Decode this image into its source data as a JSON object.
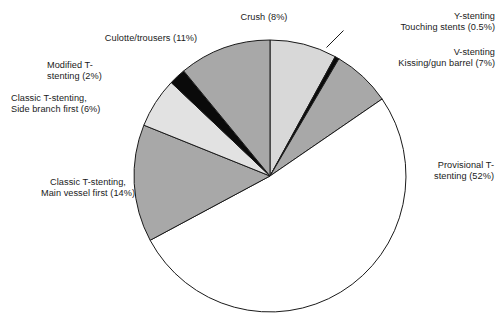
{
  "figure": {
    "background_color": "#ffffff",
    "outline_color": "#1a1a1a"
  },
  "chart_data": {
    "type": "pie",
    "title": "",
    "subtitle": "",
    "xlabel": "",
    "ylabel": "",
    "legend_position": "none",
    "labels_position": "outside-with-leader-lines",
    "start_angle_deg": -90,
    "direction": "clockwise",
    "units": "percent",
    "categories": [
      "Crush",
      "Y-stenting Touching stents",
      "V-stenting Kissing/gun barrel",
      "Provisional T-stenting",
      "Classic T-stenting, Main vessel first",
      "Classic T-stenting, Side branch first",
      "Modified T-stenting",
      "Culotte/trousers"
    ],
    "values": [
      8,
      0.5,
      7,
      52,
      14,
      6,
      2,
      11
    ],
    "slice_colors": [
      "#d8d8d8",
      "#0a0a0a",
      "#a8a8a8",
      "#ffffff",
      "#a8a8a8",
      "#e2e2e2",
      "#0a0a0a",
      "#a8a8a8"
    ],
    "slices": [
      {
        "name": "crush",
        "label": "Crush (8%)",
        "value": 8,
        "percent": "8%",
        "color": "#d8d8d8"
      },
      {
        "name": "y-stenting",
        "label": "Y-stenting\nTouching stents (0.5%)",
        "value": 0.5,
        "percent": "0.5%",
        "color": "#0a0a0a"
      },
      {
        "name": "v-stenting",
        "label": "V-stenting\nKissing/gun barrel (7%)",
        "value": 7,
        "percent": "7%",
        "color": "#a8a8a8"
      },
      {
        "name": "provisional-t",
        "label": "Provisional T-\nstenting (52%)",
        "value": 52,
        "percent": "52%",
        "color": "#ffffff"
      },
      {
        "name": "classic-t-main",
        "label": "Classic T-stenting,\nMain vessel first (14%)",
        "value": 14,
        "percent": "14%",
        "color": "#a8a8a8"
      },
      {
        "name": "classic-t-side",
        "label": "Classic T-stenting,\nSide branch first (6%)",
        "value": 6,
        "percent": "6%",
        "color": "#e2e2e2"
      },
      {
        "name": "modified-t",
        "label": "Modified T-\nstenting (2%)",
        "value": 2,
        "percent": "2%",
        "color": "#0a0a0a"
      },
      {
        "name": "culotte",
        "label": "Culotte/trousers (11%)",
        "value": 11,
        "percent": "11%",
        "color": "#a8a8a8"
      }
    ]
  },
  "labels": {
    "crush": "Crush (8%)",
    "ystenting": "Y-stenting\nTouching stents (0.5%)",
    "vstenting": "V-stenting\nKissing/gun barrel (7%)",
    "provisional": "Provisional T-\nstenting (52%)",
    "culotte": "Culotte/trousers (11%)",
    "modified": "Modified T-\nstenting (2%)",
    "classic_side": "Classic T-stenting,\nSide branch first (6%)",
    "classic_main": "Classic T-stenting,\nMain vessel first (14%)"
  }
}
